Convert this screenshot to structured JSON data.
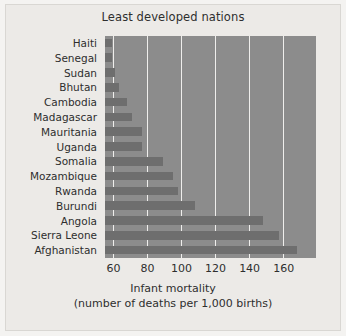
{
  "figure": {
    "background_color": "#f4f3f1",
    "panel_color": "#eceae7",
    "plot_color": "#8c8c8c",
    "bar_color": "#6e6e6e",
    "gridline_color": "#efeeec"
  },
  "chart_data": {
    "type": "bar",
    "orientation": "horizontal",
    "title": "Least developed nations",
    "xlabel_line1": "Infant mortality",
    "xlabel_line2": "(number of deaths per 1,000 births)",
    "ylabel": "",
    "grid": true,
    "legend": "none",
    "xlim": [
      55,
      179
    ],
    "xticks": [
      60,
      80,
      100,
      120,
      140,
      160
    ],
    "xtick_labels": [
      "60",
      "80",
      "100",
      "120",
      "140",
      "160"
    ],
    "categories": [
      "Haiti",
      "Senegal",
      "Sudan",
      "Bhutan",
      "Cambodia",
      "Madagascar",
      "Mauritania",
      "Uganda",
      "Somalia",
      "Mozambique",
      "Rwanda",
      "Burundi",
      "Angola",
      "Sierra Leone",
      "Afghanistan"
    ],
    "values": [
      59,
      59,
      61,
      63,
      68,
      71,
      77,
      77,
      89,
      95,
      98,
      108,
      148,
      157,
      168
    ]
  }
}
